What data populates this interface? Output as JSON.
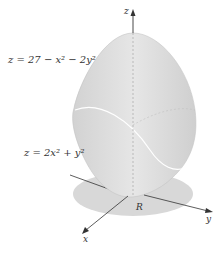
{
  "figure": {
    "top_surface_label": "z = 27 − x² − 2y²",
    "bottom_surface_label": "z = 2x² + y²",
    "region_label": "R",
    "axes": {
      "x": "x",
      "y": "y",
      "z": "z"
    }
  },
  "colors": {
    "surface": "#dcdcdc",
    "surface_shade": "#c8c8c8",
    "region": "#d6d6d6",
    "axis": "#333333",
    "curve": "#ffffff"
  }
}
